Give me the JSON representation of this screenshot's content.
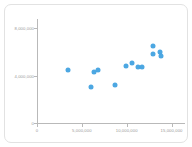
{
  "chart_data": {
    "type": "scatter",
    "title": "",
    "xlabel": "",
    "ylabel": "",
    "xlim": [
      0,
      16500000
    ],
    "ylim": [
      0,
      8800000
    ],
    "grid": false,
    "legend": null,
    "marker_color": "#3d9fe0",
    "x_ticks": [
      {
        "value": 0,
        "label": "0"
      },
      {
        "value": 5000000,
        "label": "5,000,000"
      },
      {
        "value": 10000000,
        "label": "10,000,000"
      },
      {
        "value": 15000000,
        "label": "15,000,000"
      }
    ],
    "y_ticks": [
      {
        "value": 0,
        "label": "0"
      },
      {
        "value": 4000000,
        "label": "4,000,000"
      },
      {
        "value": 8000000,
        "label": "8,000,000"
      }
    ],
    "points": [
      {
        "x": 3500000,
        "y": 4450000
      },
      {
        "x": 6000000,
        "y": 3050000
      },
      {
        "x": 6350000,
        "y": 4300000
      },
      {
        "x": 6800000,
        "y": 4450000
      },
      {
        "x": 8750000,
        "y": 3250000
      },
      {
        "x": 9950000,
        "y": 4850000
      },
      {
        "x": 10600000,
        "y": 5050000
      },
      {
        "x": 11300000,
        "y": 4700000
      },
      {
        "x": 11750000,
        "y": 4700000
      },
      {
        "x": 12900000,
        "y": 6500000
      },
      {
        "x": 12950000,
        "y": 5800000
      },
      {
        "x": 13700000,
        "y": 6050000
      },
      {
        "x": 13800000,
        "y": 5700000
      }
    ]
  },
  "card": {
    "border_color": "#e2e2e2",
    "background": "#ffffff"
  }
}
